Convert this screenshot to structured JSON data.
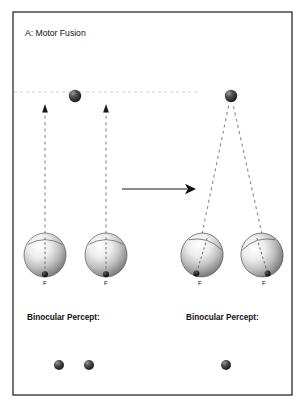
{
  "figure": {
    "panel_title": "A: Motor Fusion",
    "frame": {
      "x": 13,
      "y": 12,
      "width": 279,
      "height": 383,
      "stroke": "#3a3a3a",
      "stroke_width": 1.4
    },
    "background": "#ffffff"
  },
  "colors": {
    "ink": "#111111",
    "frame": "#3a3a3a",
    "dashed_line": "#8d8d8d",
    "faint_dashed_line": "#cfcfcf",
    "arrow": "#1a1a1a",
    "target_dot_dark": "#2a2a2a",
    "target_dot_light": "#8e8e8e",
    "eye_light": "#f2f2f2",
    "eye_mid": "#b8b8b8",
    "eye_dark": "#6e6e6e",
    "eye_outline": "#5a5a5a",
    "fovea": "#161616"
  },
  "stages": [
    {
      "name": "before-fusion",
      "state_label": "diverged",
      "percept_label": "Binocular Percept:",
      "percept_label_pos": {
        "x": 27,
        "y": 320
      },
      "percept_dots": [
        {
          "name": "percept-dot-left",
          "cx": 59,
          "cy": 365,
          "r": 5.0
        },
        {
          "name": "percept-dot-right",
          "cx": 89,
          "cy": 365,
          "r": 5.0
        }
      ],
      "target_dot": {
        "name": "fixation-target-left",
        "cx": 75,
        "cy": 96,
        "r": 6.2
      },
      "eyes": [
        {
          "name": "eye-left",
          "cx": 45,
          "cy": 255,
          "rx": 21,
          "ry": 22,
          "rotation": 0,
          "fovea_label": "F",
          "fovea_label_pos": {
            "x": 45,
            "y": 285
          }
        },
        {
          "name": "eye-right",
          "cx": 106,
          "cy": 255,
          "rx": 21,
          "ry": 22,
          "rotation": 0,
          "fovea_label": "F",
          "fovea_label_pos": {
            "x": 106,
            "y": 285
          }
        }
      ],
      "gaze_lines": [
        {
          "name": "gaze-line-left",
          "x1": 45,
          "y1": 234,
          "x2": 45,
          "y2": 104,
          "arrowhead": true
        },
        {
          "name": "gaze-line-right",
          "x1": 106,
          "y1": 234,
          "x2": 106,
          "y2": 104,
          "arrowhead": true
        }
      ]
    },
    {
      "name": "after-fusion",
      "state_label": "converged",
      "percept_label": "Binocular Percept:",
      "percept_label_pos": {
        "x": 186,
        "y": 320
      },
      "percept_dots": [
        {
          "name": "percept-dot-fused",
          "cx": 226,
          "cy": 365,
          "r": 5.0
        }
      ],
      "target_dot": {
        "name": "fixation-target-right",
        "cx": 231,
        "cy": 96,
        "r": 6.2
      },
      "eyes": [
        {
          "name": "eye-left",
          "cx": 202,
          "cy": 255,
          "rx": 21,
          "ry": 22,
          "rotation": 17,
          "fovea_label": "F",
          "fovea_label_pos": {
            "x": 200,
            "y": 285
          }
        },
        {
          "name": "eye-right",
          "cx": 262,
          "cy": 255,
          "rx": 21,
          "ry": 22,
          "rotation": -17,
          "fovea_label": "F",
          "fovea_label_pos": {
            "x": 264,
            "y": 285
          }
        }
      ],
      "gaze_lines": [
        {
          "name": "gaze-line-left",
          "x1": 202,
          "y1": 234,
          "x2": 229,
          "y2": 104,
          "arrowhead": false
        },
        {
          "name": "gaze-line-right",
          "x1": 262,
          "y1": 234,
          "x2": 233,
          "y2": 104,
          "arrowhead": false
        }
      ]
    }
  ],
  "transition_arrow": {
    "name": "transition-arrow",
    "x1": 122,
    "y1": 189,
    "x2": 196,
    "y2": 189
  },
  "horizon_line": {
    "name": "horopter-dashed-line",
    "x1": 14,
    "y1": 92,
    "x2": 200,
    "y2": 92
  }
}
